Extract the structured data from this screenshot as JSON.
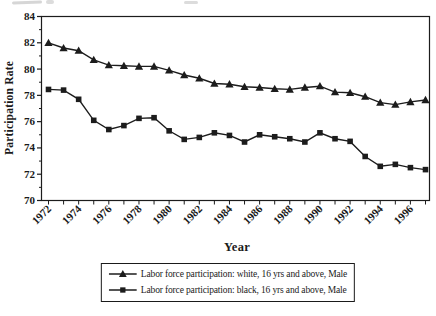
{
  "page": {
    "background": "#ffffff"
  },
  "chart_data": {
    "type": "line",
    "title": "",
    "xlabel": "Year",
    "ylabel": "Participation Rate",
    "x": [
      1972,
      1973,
      1974,
      1975,
      1976,
      1977,
      1978,
      1979,
      1980,
      1981,
      1982,
      1983,
      1984,
      1985,
      1986,
      1987,
      1988,
      1989,
      1990,
      1991,
      1992,
      1993,
      1994,
      1995,
      1996,
      1997
    ],
    "x_label_every": 2,
    "y_ticks": [
      70,
      72,
      74,
      76,
      78,
      80,
      82,
      84
    ],
    "y_minor_step": 1,
    "ylim": [
      70,
      84
    ],
    "grid": false,
    "legend_position": "bottom-center-boxed",
    "line_color": "#1c1c1c",
    "series": [
      {
        "name": "Labor force participation: white, 16 yrs and above, Male",
        "marker": "triangle",
        "values": [
          82.0,
          81.6,
          81.4,
          80.7,
          80.3,
          80.25,
          80.2,
          80.2,
          79.9,
          79.55,
          79.3,
          78.9,
          78.85,
          78.65,
          78.6,
          78.5,
          78.45,
          78.6,
          78.7,
          78.25,
          78.2,
          77.9,
          77.45,
          77.3,
          77.5,
          77.65
        ]
      },
      {
        "name": "Labor force participation: black, 16 yrs and above, Male",
        "marker": "square",
        "values": [
          78.45,
          78.4,
          77.7,
          76.1,
          75.4,
          75.7,
          76.25,
          76.3,
          75.3,
          74.65,
          74.8,
          75.15,
          74.95,
          74.45,
          75.0,
          74.85,
          74.7,
          74.45,
          75.15,
          74.7,
          74.5,
          73.35,
          72.6,
          72.75,
          72.5,
          72.35
        ]
      }
    ]
  }
}
